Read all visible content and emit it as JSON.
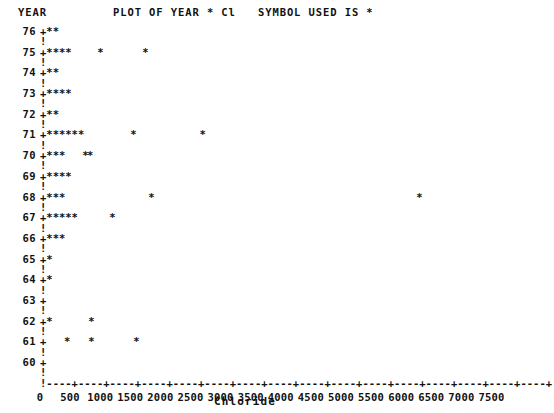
{
  "header": {
    "year_label": "YEAR",
    "title": "PLOT OF YEAR * Cl",
    "symbol_note": "SYMBOL USED IS *"
  },
  "axis": {
    "x_title": "Chloride",
    "y_title": "YEAR",
    "plot_char": "*",
    "origin_char": "+",
    "vertical_char": "!",
    "tick_char": "+",
    "fill_char": "-"
  },
  "chart_data": {
    "type": "scatter",
    "title": "PLOT OF YEAR * Cl",
    "xlabel": "Chloride",
    "ylabel": "YEAR",
    "symbol": "*",
    "xlim": [
      0,
      7800
    ],
    "ylim": [
      60,
      76
    ],
    "grid": false,
    "legend": "SYMBOL USED IS *",
    "x_ticks": [
      0,
      500,
      1000,
      1500,
      2000,
      2500,
      3000,
      3500,
      4000,
      4500,
      5000,
      5500,
      6000,
      6500,
      7000,
      7500
    ],
    "x_tick_labels": [
      "0",
      "500",
      "1000",
      "1500",
      "2000",
      "2500",
      "3000",
      "3500",
      "4000",
      "4500",
      "5000",
      "5500",
      "6000",
      "6500",
      "7000",
      "7500"
    ],
    "y_ticks": [
      60,
      61,
      62,
      63,
      64,
      65,
      66,
      67,
      68,
      69,
      70,
      71,
      72,
      73,
      74,
      75,
      76
    ],
    "y_tick_labels": [
      "60",
      "61",
      "62",
      "63",
      "64",
      "65",
      "66",
      "67",
      "68",
      "69",
      "70",
      "71",
      "72",
      "73",
      "74",
      "75",
      "76"
    ],
    "rows": [
      {
        "year": 76,
        "near_origin_stars": 2,
        "outliers": []
      },
      {
        "year": 75,
        "near_origin_stars": 4,
        "outliers": [
          950,
          1700
        ]
      },
      {
        "year": 74,
        "near_origin_stars": 2,
        "outliers": []
      },
      {
        "year": 73,
        "near_origin_stars": 4,
        "outliers": []
      },
      {
        "year": 72,
        "near_origin_stars": 2,
        "outliers": []
      },
      {
        "year": 71,
        "near_origin_stars": 6,
        "outliers": [
          1500,
          2650
        ]
      },
      {
        "year": 70,
        "near_origin_stars": 3,
        "outliers": [
          700,
          780
        ]
      },
      {
        "year": 69,
        "near_origin_stars": 4,
        "outliers": []
      },
      {
        "year": 68,
        "near_origin_stars": 3,
        "outliers": [
          1800,
          6250
        ]
      },
      {
        "year": 67,
        "near_origin_stars": 5,
        "outliers": [
          1150
        ]
      },
      {
        "year": 66,
        "near_origin_stars": 3,
        "outliers": []
      },
      {
        "year": 65,
        "near_origin_stars": 1,
        "outliers": []
      },
      {
        "year": 64,
        "near_origin_stars": 1,
        "outliers": []
      },
      {
        "year": 63,
        "near_origin_stars": 0,
        "outliers": []
      },
      {
        "year": 62,
        "near_origin_stars": 1,
        "outliers": [
          800
        ]
      },
      {
        "year": 61,
        "near_origin_stars": 0,
        "outliers": [
          400,
          800,
          1550
        ]
      },
      {
        "year": 60,
        "near_origin_stars": 0,
        "outliers": []
      }
    ]
  }
}
